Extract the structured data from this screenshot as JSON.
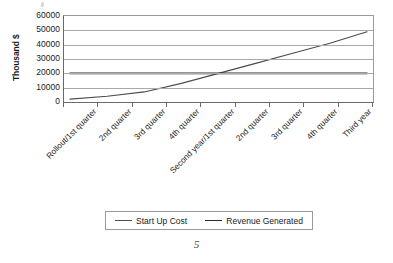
{
  "page": {
    "page_number": "5"
  },
  "legend": {
    "position": "bottom",
    "entries": [
      {
        "label": "Start Up Cost",
        "color": "#4d4d4d"
      },
      {
        "label": "Revenue Generated",
        "color": "#2b2b2b"
      }
    ]
  },
  "chart_data": {
    "type": "line",
    "title": "",
    "xlabel": "",
    "ylabel": "Thousand $",
    "ylim": [
      0,
      60000
    ],
    "ytick_labels": [
      "0",
      "10000",
      "20000",
      "30000",
      "40000",
      "50000",
      "60000"
    ],
    "ytick_values": [
      0,
      10000,
      20000,
      30000,
      40000,
      50000,
      60000
    ],
    "grid": true,
    "legend_position": "bottom",
    "categories": [
      "Rollout/1st quarter",
      "2nd quarter",
      "3rd quarter",
      "4th quarter",
      "Second year/1st quarter",
      "2nd quarter",
      "3rd quarter",
      "4th quarter",
      "Third year"
    ],
    "series": [
      {
        "name": "Start Up Cost",
        "color": "#4d4d4d",
        "values": [
          2000,
          4000,
          7000,
          13000,
          20000,
          27000,
          34000,
          41000,
          49000
        ]
      },
      {
        "name": "Revenue Generated",
        "color": "#2b2b2b",
        "values": [
          20000,
          20000,
          20000,
          20000,
          20000,
          20000,
          20000,
          20000,
          20000
        ]
      }
    ]
  }
}
